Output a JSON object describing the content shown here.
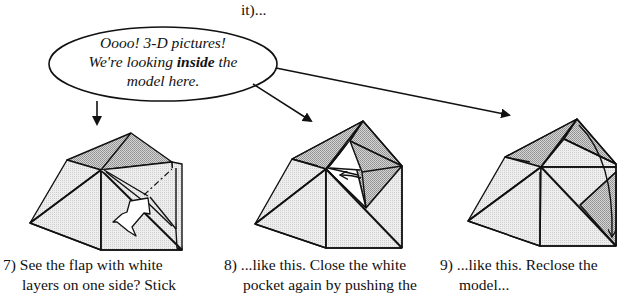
{
  "header": {
    "continued_fragment": "it)..."
  },
  "speech_bubble": {
    "line1": "Oooo! 3-D pictures!",
    "line2_pre": "We're looking ",
    "line2_bold": "inside",
    "line2_post": " the",
    "line3": "model here."
  },
  "steps": [
    {
      "number": "7)",
      "line1": "See the flap with white",
      "line2": "layers on one side?  Stick"
    },
    {
      "number": "8)",
      "line1": "...like this.  Close the white",
      "line2": "pocket again by pushing the"
    },
    {
      "number": "9)",
      "line1": "...like this.  Reclose the",
      "line2": "model..."
    }
  ],
  "colors": {
    "line": "#111111",
    "shade_dark": "#b4b4b4",
    "shade_light": "#e3e3e3",
    "paper": "#ffffff"
  },
  "icons": {
    "pointer_arrows": "arrow-right",
    "push_arrow": "hollow-push-arrow",
    "fold_arrow": "curved-fold-arrow"
  }
}
